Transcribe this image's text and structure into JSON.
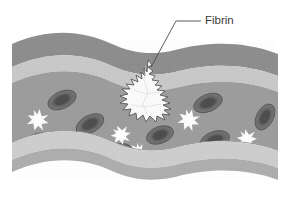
{
  "figure": {
    "background_color": "#ffffff",
    "width": 290,
    "height": 200
  },
  "annotations": [
    {
      "id": "fibrin",
      "label": "Fibrin",
      "text_x": 205,
      "text_y": 21,
      "leader_color": "#4a4a4a",
      "leader_path": "M 201 21 L 176 21 L 151 67"
    }
  ],
  "vessel": {
    "name": "blood-vessel",
    "layers": [
      {
        "name": "outer-wall-top",
        "color": "#8e8e8e",
        "y_top": 42,
        "y_bottom": 70
      },
      {
        "name": "inner-band-top",
        "color": "#c6c6c6",
        "y_top": 70,
        "y_bottom": 84
      },
      {
        "name": "lumen",
        "color": "#9d9d9d",
        "y_top": 84,
        "y_bottom": 148
      },
      {
        "name": "inner-band-bottom",
        "color": "#c9c9c9",
        "y_top": 148,
        "y_bottom": 163
      },
      {
        "name": "outer-wall-bottom",
        "color": "#a8a8a8",
        "y_top": 163,
        "y_bottom": 179
      }
    ],
    "left_edge": 12,
    "right_edge": 278,
    "wave_amplitude": 11
  },
  "red_blood_cells": [
    {
      "id": "rbc-1",
      "cx": 62,
      "cy": 100,
      "rx": 15,
      "ry": 8.5,
      "rotation": -24
    },
    {
      "id": "rbc-2",
      "cx": 90,
      "cy": 124,
      "rx": 15,
      "ry": 8.5,
      "rotation": -28
    },
    {
      "id": "rbc-3",
      "cx": 38,
      "cy": 142,
      "rx": 15,
      "ry": 8.5,
      "rotation": -16
    },
    {
      "id": "rbc-4",
      "cx": 160,
      "cy": 135,
      "rx": 14,
      "ry": 8.5,
      "rotation": -20
    },
    {
      "id": "rbc-5",
      "cx": 208,
      "cy": 103,
      "rx": 15,
      "ry": 8.5,
      "rotation": -22
    },
    {
      "id": "rbc-6",
      "cx": 265,
      "cy": 117,
      "rx": 14,
      "ry": 8.5,
      "rotation": -62
    },
    {
      "id": "rbc-7",
      "cx": 215,
      "cy": 140,
      "rx": 15,
      "ry": 8.5,
      "rotation": -18
    },
    {
      "id": "rbc-8",
      "cx": 118,
      "cy": 152,
      "rx": 14,
      "ry": 8,
      "rotation": -14
    }
  ],
  "platelets": [
    {
      "id": "platelet-1",
      "cx": 38,
      "cy": 120,
      "r": 11
    },
    {
      "id": "platelet-2",
      "cx": 121,
      "cy": 135,
      "r": 10
    },
    {
      "id": "platelet-3",
      "cx": 189,
      "cy": 120,
      "r": 11
    },
    {
      "id": "platelet-4",
      "cx": 247,
      "cy": 139,
      "r": 10
    },
    {
      "id": "platelet-5",
      "cx": 138,
      "cy": 152,
      "r": 9
    }
  ],
  "fibrin_clot": {
    "id": "fibrin-clot",
    "fill_color": "#fbfbfb",
    "stroke_color": "#4f4f4f",
    "center_x": 143,
    "center_y": 92
  },
  "colors": {
    "outer_wall": "#8e8e8e",
    "inner_band": "#c6c6c6",
    "lumen": "#9d9d9d",
    "rbc_body": "#6f6f6f",
    "rbc_center": "#555555",
    "platelet": "#ffffff",
    "fibrin": "#fbfbfb",
    "label": "#3b3b3b"
  }
}
